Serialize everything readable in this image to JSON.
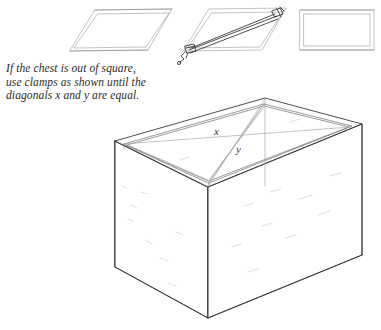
{
  "figure": {
    "caption": {
      "line1": "If the chest is out of square,",
      "line2": "use clamps as shown until the",
      "line3": "diagonals x and y are equal."
    },
    "labels": {
      "x": "x",
      "y": "y"
    },
    "colors": {
      "ink": "#3a3a3a",
      "ink_dark": "#2b2b2b",
      "ink_light": "#9a9a9a",
      "paper": "#ffffff",
      "grain": "#c9c9c9"
    },
    "steps": [
      {
        "name": "out-of-square-frame",
        "description": "Frame racked out of square"
      },
      {
        "name": "clamped-frame",
        "description": "Clamp applied across the long diagonal"
      },
      {
        "name": "squared-frame",
        "description": "Frame pulled back to square"
      }
    ],
    "chest": {
      "name": "open-chest-carcase",
      "description": "Isometric view of an open chest with diagonals x and y drawn across the top opening"
    }
  }
}
